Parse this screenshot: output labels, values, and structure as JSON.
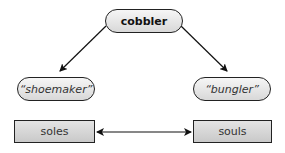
{
  "diagram": {
    "root": {
      "label": "cobbler"
    },
    "meanings": [
      {
        "label": "“shoemaker”"
      },
      {
        "label": "“bungler”"
      }
    ],
    "homophones": [
      {
        "label": "soles"
      },
      {
        "label": "souls"
      }
    ],
    "edges": [
      {
        "from": "cobbler",
        "to": "shoemaker",
        "type": "arrow"
      },
      {
        "from": "cobbler",
        "to": "bungler",
        "type": "arrow"
      },
      {
        "from": "soles",
        "to": "souls",
        "type": "double-arrow"
      }
    ],
    "colors": {
      "stroke": "#222222",
      "fill_light": "#f0f0f0",
      "fill_rect": "#d4d4d4",
      "text": "#333333"
    }
  }
}
